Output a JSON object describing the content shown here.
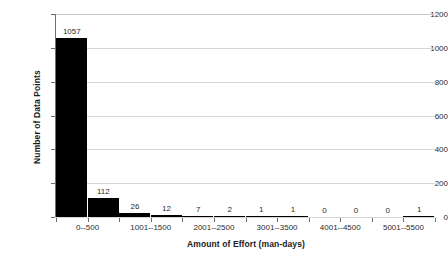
{
  "chart_data": {
    "type": "bar",
    "title": "",
    "subtitle": "",
    "xlabel": "Amount of Effort (man-days)",
    "ylabel": "Number of Data Points",
    "categories": [
      "0--500",
      "501--1000",
      "1001--1500",
      "1501--2000",
      "2001--2500",
      "2501--3000",
      "3001--3500",
      "3501--4000",
      "4001--4500",
      "4501--5000",
      "5001--5500",
      "5501--6000"
    ],
    "visible_tick_labels": [
      "0--500",
      "1001--1500",
      "2001--2500",
      "3001--3500",
      "4001--4500",
      "5001--5500"
    ],
    "visible_tick_label_indices": [
      0,
      2,
      4,
      6,
      8,
      10
    ],
    "values": [
      1057,
      112,
      26,
      12,
      7,
      2,
      1,
      1,
      0,
      0,
      0,
      1
    ],
    "value_labels": [
      "1057",
      "112",
      "26",
      "12",
      "7",
      "2",
      "1",
      "1",
      "0",
      "0",
      "0",
      "1"
    ],
    "ylim": [
      0,
      1200
    ],
    "ytick_values": [
      0,
      200,
      400,
      600,
      800,
      1000,
      1200
    ],
    "ytick_labels": [
      "0",
      "200",
      "400",
      "600",
      "800",
      "1000",
      "1200"
    ],
    "grid": true,
    "legend": null,
    "bar_color": "#000000",
    "grid_color": "#d7d7d7",
    "axis_color": "#6f6f6f",
    "text_color": "#2b2b2b"
  }
}
